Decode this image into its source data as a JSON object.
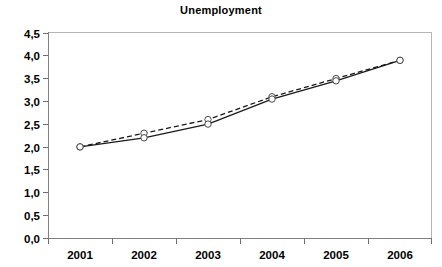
{
  "chart_data": {
    "type": "line",
    "title": "Unemployment",
    "xlabel": "",
    "ylabel": "",
    "categories": [
      "2001",
      "2002",
      "2003",
      "2004",
      "2005",
      "2006"
    ],
    "series": [
      {
        "name": "solid-series",
        "style": "solid",
        "marker": "open-circle",
        "color": "#1a1a1a",
        "values": [
          2.0,
          2.2,
          2.5,
          3.05,
          3.45,
          3.9
        ]
      },
      {
        "name": "dashed-series",
        "style": "dashed",
        "marker": "open-circle",
        "color": "#1a1a1a",
        "values": [
          2.0,
          2.3,
          2.6,
          3.1,
          3.5,
          3.9
        ]
      }
    ],
    "ylim": [
      0.0,
      4.5
    ],
    "ytick_labels": [
      "0,0",
      "0,5",
      "1,0",
      "1,5",
      "2,0",
      "2,5",
      "3,0",
      "3,5",
      "4,0",
      "4,5"
    ],
    "ytick_values": [
      0.0,
      0.5,
      1.0,
      1.5,
      2.0,
      2.5,
      3.0,
      3.5,
      4.0,
      4.5
    ],
    "grid": false,
    "legend": false,
    "legend_position": "none",
    "decimal_separator": ","
  }
}
